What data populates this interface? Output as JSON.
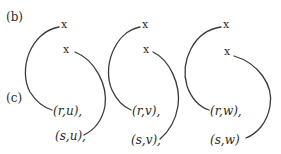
{
  "labels": {
    "b": "(b)",
    "c": "(c)"
  },
  "marks": {
    "x": "x"
  },
  "panels": [
    {
      "variable": "u",
      "top_mark": "x",
      "bottom_mark": "x",
      "pair_r": "(r,u),",
      "pair_s": "(s,u),"
    },
    {
      "variable": "v",
      "top_mark": "x",
      "bottom_mark": "x",
      "pair_r": "(r,v),",
      "pair_s": "(s,v),"
    },
    {
      "variable": "w",
      "top_mark": "x",
      "bottom_mark": "x",
      "pair_r": "(r,w),",
      "pair_s": "(s,w)"
    }
  ],
  "colors": {
    "ink": "#2a2a2a",
    "stroke": "#3a3a3a",
    "background": "#ffffff"
  }
}
